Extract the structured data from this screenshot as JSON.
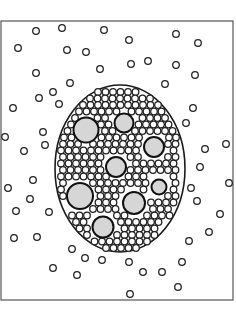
{
  "diagram": {
    "title": "",
    "frame": {
      "x": 1,
      "y": 21,
      "width": 232,
      "height": 279
    },
    "cluster_ellipse": {
      "cx": 120,
      "cy": 168.5,
      "rx": 65,
      "ry": 83.5
    },
    "colors": {
      "large_fill": "#d6d6d6",
      "stroke": "#1a1a1a",
      "background": "#ffffff"
    },
    "small_radius": 3.3,
    "large_circles": [
      {
        "cx": 86,
        "cy": 130,
        "r": 12.5
      },
      {
        "cx": 124,
        "cy": 123,
        "r": 9.5
      },
      {
        "cx": 154,
        "cy": 147,
        "r": 10
      },
      {
        "cx": 116,
        "cy": 167,
        "r": 10
      },
      {
        "cx": 159,
        "cy": 187,
        "r": 7.5
      },
      {
        "cx": 80,
        "cy": 196,
        "r": 13
      },
      {
        "cx": 134,
        "cy": 203,
        "r": 11
      },
      {
        "cx": 103,
        "cy": 227,
        "r": 10.5
      }
    ],
    "outer_small_circles": [
      [
        36,
        31
      ],
      [
        62,
        28
      ],
      [
        104,
        30
      ],
      [
        129,
        40
      ],
      [
        176,
        34
      ],
      [
        198,
        43
      ],
      [
        18,
        48
      ],
      [
        67,
        50
      ],
      [
        86,
        52
      ],
      [
        131,
        64
      ],
      [
        148,
        61
      ],
      [
        176,
        65
      ],
      [
        195,
        75
      ],
      [
        36,
        73
      ],
      [
        100,
        69
      ],
      [
        70,
        83
      ],
      [
        165,
        84
      ],
      [
        53,
        92
      ],
      [
        39,
        98
      ],
      [
        59,
        104
      ],
      [
        13,
        108
      ],
      [
        193,
        108
      ],
      [
        186,
        123
      ],
      [
        43,
        132
      ],
      [
        5,
        137
      ],
      [
        45,
        145
      ],
      [
        24,
        151
      ],
      [
        226,
        144
      ],
      [
        205,
        149
      ],
      [
        200,
        167
      ],
      [
        33,
        180
      ],
      [
        8,
        188
      ],
      [
        229,
        183
      ],
      [
        191,
        188
      ],
      [
        30,
        199
      ],
      [
        197,
        201
      ],
      [
        16,
        211
      ],
      [
        49,
        212
      ],
      [
        220,
        214
      ],
      [
        209,
        232
      ],
      [
        189,
        241
      ],
      [
        14,
        238
      ],
      [
        37,
        237
      ],
      [
        72,
        249
      ],
      [
        85,
        258
      ],
      [
        102,
        260
      ],
      [
        129,
        262
      ],
      [
        182,
        262
      ],
      [
        53,
        268
      ],
      [
        77,
        275
      ],
      [
        143,
        272
      ],
      [
        162,
        272
      ],
      [
        178,
        287
      ],
      [
        130,
        294
      ]
    ],
    "inner_small_circles": [
      [
        98,
        92
      ],
      [
        105.5,
        92
      ],
      [
        113,
        92
      ],
      [
        120.5,
        92
      ],
      [
        128,
        92
      ],
      [
        135.5,
        92
      ],
      [
        90,
        98.5
      ],
      [
        97.5,
        98.5
      ],
      [
        105,
        98.5
      ],
      [
        112.5,
        98.5
      ],
      [
        120,
        98.5
      ],
      [
        127.5,
        98.5
      ],
      [
        135,
        98.5
      ],
      [
        142.5,
        98.5
      ],
      [
        150,
        98.5
      ],
      [
        83,
        105
      ],
      [
        90.5,
        105
      ],
      [
        98,
        105
      ],
      [
        105.5,
        105
      ],
      [
        113,
        105
      ],
      [
        120.5,
        105
      ],
      [
        128,
        105
      ],
      [
        135.5,
        105
      ],
      [
        143,
        105
      ],
      [
        150.5,
        105
      ],
      [
        158,
        105
      ],
      [
        79,
        111.5
      ],
      [
        86.5,
        111.5
      ],
      [
        94,
        111.5
      ],
      [
        101.5,
        111.5
      ],
      [
        109,
        111.5
      ],
      [
        116.5,
        111.5
      ],
      [
        131.5,
        111.5
      ],
      [
        139,
        111.5
      ],
      [
        146.5,
        111.5
      ],
      [
        154,
        111.5
      ],
      [
        161.5,
        111.5
      ],
      [
        75,
        118
      ],
      [
        97.5,
        118
      ],
      [
        105,
        118
      ],
      [
        142.5,
        118
      ],
      [
        150,
        118
      ],
      [
        157.5,
        118
      ],
      [
        165,
        118
      ],
      [
        71,
        124.5
      ],
      [
        101,
        124.5
      ],
      [
        108.5,
        124.5
      ],
      [
        138.5,
        124.5
      ],
      [
        146,
        124.5
      ],
      [
        153.5,
        124.5
      ],
      [
        161,
        124.5
      ],
      [
        168.5,
        124.5
      ],
      [
        67.5,
        131
      ],
      [
        105,
        131
      ],
      [
        112.5,
        131
      ],
      [
        135,
        131
      ],
      [
        142.5,
        131
      ],
      [
        150,
        131
      ],
      [
        157.5,
        131
      ],
      [
        165,
        131
      ],
      [
        172.5,
        131
      ],
      [
        64,
        137.5
      ],
      [
        71.5,
        137.5
      ],
      [
        101.5,
        137.5
      ],
      [
        109,
        137.5
      ],
      [
        116.5,
        137.5
      ],
      [
        124,
        137.5
      ],
      [
        131.5,
        137.5
      ],
      [
        139,
        137.5
      ],
      [
        169,
        137.5
      ],
      [
        176,
        137.5
      ],
      [
        63,
        144
      ],
      [
        70.5,
        144
      ],
      [
        78,
        144
      ],
      [
        93,
        144
      ],
      [
        100.5,
        144
      ],
      [
        108,
        144
      ],
      [
        115.5,
        144
      ],
      [
        123,
        144
      ],
      [
        130.5,
        144
      ],
      [
        138,
        144
      ],
      [
        168,
        144
      ],
      [
        175.5,
        144
      ],
      [
        61,
        150.5
      ],
      [
        68.5,
        150.5
      ],
      [
        76,
        150.5
      ],
      [
        83.5,
        150.5
      ],
      [
        91,
        150.5
      ],
      [
        98.5,
        150.5
      ],
      [
        106,
        150.5
      ],
      [
        113.5,
        150.5
      ],
      [
        121,
        150.5
      ],
      [
        128.5,
        150.5
      ],
      [
        136,
        150.5
      ],
      [
        173.5,
        150.5
      ],
      [
        63,
        157
      ],
      [
        70.5,
        157
      ],
      [
        78,
        157
      ],
      [
        85.5,
        157
      ],
      [
        93,
        157
      ],
      [
        100.5,
        157
      ],
      [
        130.5,
        157
      ],
      [
        138,
        157
      ],
      [
        168,
        157
      ],
      [
        175.5,
        157
      ],
      [
        61,
        163.5
      ],
      [
        68.5,
        163.5
      ],
      [
        76,
        163.5
      ],
      [
        83.5,
        163.5
      ],
      [
        91,
        163.5
      ],
      [
        98.5,
        163.5
      ],
      [
        136,
        163.5
      ],
      [
        143.5,
        163.5
      ],
      [
        151,
        163.5
      ],
      [
        158.5,
        163.5
      ],
      [
        166,
        163.5
      ],
      [
        173.5,
        163.5
      ],
      [
        63,
        170
      ],
      [
        70.5,
        170
      ],
      [
        78,
        170
      ],
      [
        85.5,
        170
      ],
      [
        93,
        170
      ],
      [
        100.5,
        170
      ],
      [
        130.5,
        170
      ],
      [
        138,
        170
      ],
      [
        145.5,
        170
      ],
      [
        153,
        170
      ],
      [
        160.5,
        170
      ],
      [
        168,
        170
      ],
      [
        175.5,
        170
      ],
      [
        61,
        176.5
      ],
      [
        68.5,
        176.5
      ],
      [
        76,
        176.5
      ],
      [
        83.5,
        176.5
      ],
      [
        91,
        176.5
      ],
      [
        98.5,
        176.5
      ],
      [
        106,
        176.5
      ],
      [
        128.5,
        176.5
      ],
      [
        136,
        176.5
      ],
      [
        143.5,
        176.5
      ],
      [
        173.5,
        176.5
      ],
      [
        63,
        183
      ],
      [
        93,
        183
      ],
      [
        100.5,
        183
      ],
      [
        108,
        183
      ],
      [
        115.5,
        183
      ],
      [
        123,
        183
      ],
      [
        130.5,
        183
      ],
      [
        138,
        183
      ],
      [
        145.5,
        183
      ],
      [
        175.5,
        183
      ],
      [
        61,
        189.5
      ],
      [
        98.5,
        189.5
      ],
      [
        106,
        189.5
      ],
      [
        113.5,
        189.5
      ],
      [
        121,
        189.5
      ],
      [
        143.5,
        189.5
      ],
      [
        173.5,
        189.5
      ],
      [
        63,
        196
      ],
      [
        100.5,
        196
      ],
      [
        108,
        196
      ],
      [
        115.5,
        196
      ],
      [
        168,
        196
      ],
      [
        175.5,
        196
      ],
      [
        98.5,
        202.5
      ],
      [
        106,
        202.5
      ],
      [
        113.5,
        202.5
      ],
      [
        151,
        202.5
      ],
      [
        158.5,
        202.5
      ],
      [
        166,
        202.5
      ],
      [
        173.5,
        202.5
      ],
      [
        93,
        209
      ],
      [
        100.5,
        209
      ],
      [
        108,
        209
      ],
      [
        115.5,
        209
      ],
      [
        153,
        209
      ],
      [
        160.5,
        209
      ],
      [
        168,
        209
      ],
      [
        72,
        215.5
      ],
      [
        79.5,
        215.5
      ],
      [
        87,
        215.5
      ],
      [
        117,
        215.5
      ],
      [
        124.5,
        215.5
      ],
      [
        147,
        215.5
      ],
      [
        154.5,
        215.5
      ],
      [
        162,
        215.5
      ],
      [
        169.5,
        215.5
      ],
      [
        76,
        222
      ],
      [
        83.5,
        222
      ],
      [
        121,
        222
      ],
      [
        128.5,
        222
      ],
      [
        136,
        222
      ],
      [
        143.5,
        222
      ],
      [
        151,
        222
      ],
      [
        158.5,
        222
      ],
      [
        79.5,
        228.5
      ],
      [
        87,
        228.5
      ],
      [
        124.5,
        228.5
      ],
      [
        132,
        228.5
      ],
      [
        139.5,
        228.5
      ],
      [
        147,
        228.5
      ],
      [
        154.5,
        228.5
      ],
      [
        87,
        235
      ],
      [
        117,
        235
      ],
      [
        124.5,
        235
      ],
      [
        132,
        235
      ],
      [
        139.5,
        235
      ],
      [
        147,
        235
      ],
      [
        154.5,
        235
      ],
      [
        94.5,
        241.5
      ],
      [
        102,
        241.5
      ],
      [
        109.5,
        241.5
      ],
      [
        117,
        241.5
      ],
      [
        124.5,
        241.5
      ],
      [
        132,
        241.5
      ],
      [
        139.5,
        241.5
      ],
      [
        147,
        241.5
      ],
      [
        106,
        248
      ],
      [
        113.5,
        248
      ],
      [
        121,
        248
      ],
      [
        128.5,
        248
      ],
      [
        136,
        248
      ]
    ]
  }
}
